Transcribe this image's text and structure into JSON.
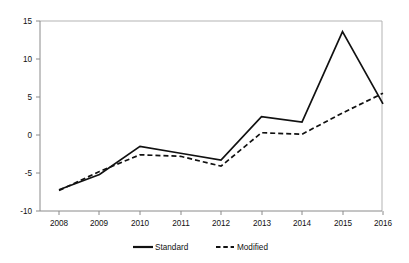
{
  "chart_data": {
    "type": "line",
    "title": "",
    "subtitle": "",
    "xlabel": "",
    "ylabel": "",
    "categories": [
      "2008",
      "2009",
      "2010",
      "2011",
      "2012",
      "2013",
      "2014",
      "2015",
      "2016"
    ],
    "series": [
      {
        "name": "Standard",
        "style": "solid",
        "color": "#111111",
        "values": [
          -7.2,
          -5.2,
          -1.5,
          -2.4,
          -3.3,
          2.4,
          1.7,
          13.6,
          4.1
        ]
      },
      {
        "name": "Modified",
        "style": "dashed",
        "color": "#111111",
        "values": [
          -7.3,
          -4.8,
          -2.6,
          -2.8,
          -4.1,
          0.3,
          0.1,
          2.9,
          5.5
        ]
      }
    ],
    "ylim": [
      -10,
      15
    ],
    "yticks": [
      -10,
      -5,
      0,
      5,
      10,
      15
    ],
    "ytick_labels": [
      "-10",
      "-5",
      "0",
      "5",
      "10",
      "15"
    ],
    "xtick_labels": [
      "2008",
      "2009",
      "2010",
      "2011",
      "2012",
      "2013",
      "2014",
      "2015",
      "2016"
    ],
    "grid": false,
    "legend_position": "bottom",
    "legend_entries": [
      "Standard",
      "Modified"
    ]
  },
  "legend": {
    "standard_label": "Standard",
    "modified_label": "Modified"
  },
  "axes": {
    "y_labels": [
      "15",
      "10",
      "5",
      "0",
      "-5",
      "-10"
    ],
    "x_labels": [
      "2008",
      "2009",
      "2010",
      "2011",
      "2012",
      "2013",
      "2014",
      "2015",
      "2016"
    ]
  },
  "colors": {
    "series_line": "#111111",
    "axis": "#8a8a8a",
    "frame": "#b3b3b3",
    "background": "#ffffff"
  }
}
